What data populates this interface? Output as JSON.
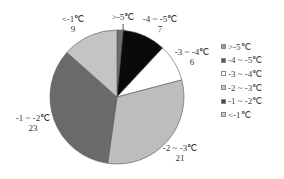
{
  "chart_data": {
    "type": "pie",
    "title": "",
    "categories": [
      ">-5℃",
      "-4 ~ -5℃",
      "-3 ~ -4℃",
      "-2 ~ -3℃",
      "-1 ~ -2℃",
      "<-1℃"
    ],
    "values": [
      1,
      7,
      6,
      21,
      23,
      9
    ],
    "colors": [
      "#6e6e6e",
      "#0a0a0a",
      "#ffffff",
      "#bdbdbd",
      "#6a6a6a",
      "#c4c4c4"
    ],
    "legend_position": "right",
    "data_labels": [
      {
        "name": ">-5℃",
        "value": "1"
      },
      {
        "name": "-4 ~ -5℃",
        "value": "7"
      },
      {
        "name": "-3 ~ -4℃",
        "value": "6"
      },
      {
        "name": "-2 ~ -3℃",
        "value": "21"
      },
      {
        "name": "-1 ~ -2℃",
        "value": "23"
      },
      {
        "name": "<-1℃",
        "value": "9"
      }
    ]
  },
  "legend": {
    "items": [
      {
        "label": ">-5℃",
        "color": "#9a9a9a"
      },
      {
        "label": "-4 ~ -5℃",
        "color": "#555555"
      },
      {
        "label": "-3 ~ -4℃",
        "color": "#ffffff"
      },
      {
        "label": "-2 ~ -3℃",
        "color": "#c8c8c8"
      },
      {
        "label": "-1 ~ -2℃",
        "color": "#444444"
      },
      {
        "label": "<-1℃",
        "color": "#c8c8c8"
      }
    ]
  }
}
